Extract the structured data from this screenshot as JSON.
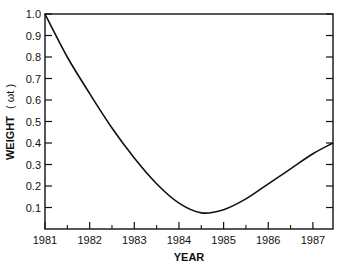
{
  "chart_data": {
    "type": "line",
    "title": "",
    "xlabel": "YEAR",
    "ylabel": "WEIGHT ( ω_t )",
    "ylabel_main": "WEIGHT",
    "ylabel_symbol": "( ωt )",
    "x_ticks": [
      "1981",
      "1982",
      "1983",
      "1984",
      "1985",
      "1986",
      "1987"
    ],
    "y_ticks": [
      "0.1",
      "0.2",
      "0.3",
      "0.4",
      "0.5",
      "0.6",
      "0.7",
      "0.8",
      "0.9",
      "1.0"
    ],
    "xlim": [
      1981,
      1987.45
    ],
    "ylim": [
      0,
      1.0
    ],
    "grid": false,
    "legend": null,
    "series": [
      {
        "name": "weight",
        "x": [
          1981,
          1981.5,
          1982,
          1982.5,
          1983,
          1983.5,
          1984,
          1984.5,
          1985,
          1985.5,
          1986,
          1986.5,
          1987,
          1987.45
        ],
        "values": [
          1.0,
          0.8,
          0.63,
          0.47,
          0.33,
          0.21,
          0.12,
          0.075,
          0.09,
          0.14,
          0.21,
          0.28,
          0.35,
          0.4
        ]
      }
    ]
  }
}
